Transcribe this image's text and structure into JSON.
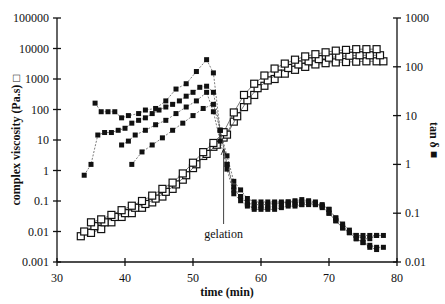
{
  "chart_data": {
    "type": "scatter",
    "title": "",
    "xlabel": "time (min)",
    "ylabel": "complex viscosity (Pa.s) □",
    "ylabel_right": "tan δ ■",
    "xlim": [
      30,
      80
    ],
    "ylim": [
      0.001,
      100000
    ],
    "ylim_right": [
      0.01,
      1000
    ],
    "yscale": "log",
    "grid": false,
    "x_ticks": [
      "30",
      "40",
      "50",
      "60",
      "70",
      "80"
    ],
    "y_ticks": [
      "0.001",
      "0.01",
      "0.1",
      "1",
      "10",
      "100",
      "1000",
      "10000",
      "100000"
    ],
    "y_ticks_right": [
      "0.01",
      "0.1",
      "1",
      "10",
      "100",
      "1000"
    ],
    "annotations": [
      {
        "text": "gelation",
        "x": 54.5,
        "arrow_to_y_viscosity": 8
      }
    ],
    "series": [
      {
        "name": "complex viscosity run 1",
        "axis": "left",
        "marker": "open-square",
        "x": [
          33.5,
          35,
          36.5,
          38,
          39.5,
          41,
          42.5,
          44,
          45.5,
          47,
          48.5,
          50,
          51.5,
          53,
          54.5,
          56,
          57.5,
          59,
          60.5,
          62,
          63.5,
          65,
          66.5,
          68,
          69.5,
          71,
          72.5,
          74,
          75.5,
          77,
          78
        ],
        "values": [
          0.007,
          0.009,
          0.012,
          0.02,
          0.03,
          0.04,
          0.06,
          0.09,
          0.14,
          0.25,
          0.5,
          1.2,
          3,
          6,
          12,
          40,
          120,
          300,
          600,
          1000,
          1500,
          2000,
          2500,
          3000,
          3300,
          3500,
          3600,
          3700,
          3800,
          3800,
          3800
        ]
      },
      {
        "name": "complex viscosity run 2",
        "axis": "left",
        "marker": "open-square",
        "x": [
          34,
          35.5,
          37,
          38.5,
          40,
          41.5,
          43,
          44.5,
          46,
          47.5,
          49,
          50.5,
          52,
          53.5,
          55,
          56.5,
          58,
          59.5,
          61,
          62.5,
          64,
          65.5,
          67,
          68.5,
          70,
          71.5,
          73,
          74.5,
          76,
          77.5
        ],
        "values": [
          0.01,
          0.015,
          0.02,
          0.03,
          0.04,
          0.06,
          0.08,
          0.12,
          0.2,
          0.35,
          0.7,
          1.6,
          3.5,
          7,
          15,
          60,
          200,
          500,
          900,
          1500,
          2300,
          3000,
          3800,
          4500,
          5000,
          5500,
          5800,
          6000,
          6000,
          6000
        ]
      },
      {
        "name": "complex viscosity run 3",
        "axis": "left",
        "marker": "open-square",
        "x": [
          35,
          36.5,
          38,
          39.5,
          41,
          42.5,
          44,
          45.5,
          47,
          48.5,
          50,
          51.5,
          53,
          54.5,
          56,
          57.5,
          59,
          60.5,
          62,
          63.5,
          65,
          66.5,
          68,
          69.5,
          71,
          72.5,
          74,
          75.5,
          77
        ],
        "values": [
          0.02,
          0.025,
          0.035,
          0.05,
          0.07,
          0.1,
          0.15,
          0.25,
          0.4,
          0.8,
          1.8,
          4,
          8,
          18,
          80,
          300,
          700,
          1300,
          2200,
          3200,
          4300,
          5500,
          6500,
          7500,
          8500,
          9000,
          9500,
          9500,
          9500
        ]
      },
      {
        "name": "tan delta run 1",
        "axis": "right",
        "marker": "filled-square",
        "x": [
          35.6,
          36.5,
          37.5,
          38.5,
          39.5,
          40.5,
          42,
          43,
          44.5,
          46,
          47.5,
          49,
          50.5,
          52,
          53,
          54,
          55,
          56,
          57,
          58,
          59,
          60,
          61,
          62,
          63,
          64,
          65,
          66,
          67,
          68,
          69,
          70,
          71,
          72,
          73,
          74,
          75,
          76,
          77
        ],
        "values": [
          18,
          12,
          12,
          12,
          9,
          10,
          11,
          13,
          14,
          20,
          35,
          45,
          80,
          140,
          75,
          5,
          1.5,
          0.45,
          0.3,
          0.2,
          0.17,
          0.17,
          0.17,
          0.17,
          0.17,
          0.17,
          0.18,
          0.19,
          0.18,
          0.17,
          0.13,
          0.1,
          0.07,
          0.05,
          0.04,
          0.035,
          0.035,
          0.035,
          0.035
        ]
      },
      {
        "name": "tan delta run 2",
        "axis": "right",
        "marker": "filled-square",
        "x": [
          34,
          35,
          36,
          37,
          38,
          39,
          40,
          41,
          42,
          43,
          44,
          45,
          46,
          47,
          48,
          49,
          50,
          51,
          52,
          53,
          54,
          55,
          56,
          57,
          58,
          59,
          60,
          61,
          62,
          63,
          64,
          65,
          66,
          67,
          68,
          69,
          70,
          71,
          72,
          73,
          74,
          75,
          76,
          77,
          78
        ],
        "values": [
          0.6,
          1,
          4,
          4.5,
          4.5,
          5,
          5.5,
          7,
          8,
          9,
          11,
          13,
          15,
          17,
          20,
          25,
          30,
          38,
          40,
          30,
          5,
          1,
          0.3,
          0.22,
          0.16,
          0.15,
          0.15,
          0.15,
          0.16,
          0.16,
          0.17,
          0.17,
          0.17,
          0.17,
          0.16,
          0.15,
          0.12,
          0.08,
          0.06,
          0.045,
          0.035,
          0.03,
          0.03,
          0.035,
          0.035
        ]
      },
      {
        "name": "tan delta run 3",
        "axis": "right",
        "marker": "filled-square",
        "x": [
          39.5,
          40.5,
          41.5,
          43,
          44.5,
          46,
          47.5,
          49,
          50.5,
          52,
          53,
          54,
          55,
          56,
          57,
          58,
          59,
          60,
          61,
          62,
          63,
          64,
          65,
          66,
          67,
          68,
          69,
          70,
          71,
          72,
          73,
          74,
          75,
          76,
          77,
          78
        ],
        "values": [
          2.5,
          3,
          4,
          5,
          6.5,
          8,
          11,
          15,
          20,
          30,
          12,
          3,
          0.8,
          0.25,
          0.18,
          0.14,
          0.13,
          0.13,
          0.13,
          0.14,
          0.14,
          0.15,
          0.15,
          0.15,
          0.16,
          0.15,
          0.14,
          0.1,
          0.07,
          0.05,
          0.04,
          0.03,
          0.025,
          0.022,
          0.02,
          0.02
        ]
      },
      {
        "name": "tan delta run 4",
        "axis": "right",
        "marker": "filled-square",
        "x": [
          41,
          42.5,
          44,
          45.5,
          47,
          48.5,
          50,
          51.5,
          53,
          54,
          55,
          56,
          57,
          58,
          59,
          60,
          61,
          62,
          63,
          64,
          65,
          66,
          67,
          68,
          69,
          70,
          71,
          72,
          73,
          74,
          75,
          76,
          77
        ],
        "values": [
          1,
          1.8,
          2.5,
          3.5,
          5,
          7,
          10,
          14,
          17,
          5,
          1,
          0.35,
          0.22,
          0.15,
          0.12,
          0.12,
          0.12,
          0.12,
          0.13,
          0.14,
          0.14,
          0.15,
          0.15,
          0.15,
          0.14,
          0.12,
          0.08,
          0.055,
          0.04,
          0.03,
          0.025,
          0.02,
          0.018
        ]
      }
    ]
  }
}
